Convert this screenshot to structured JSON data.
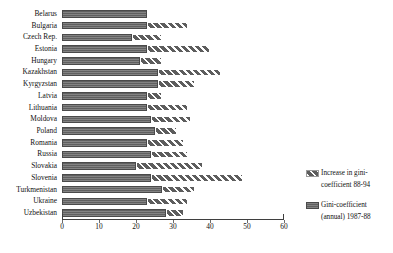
{
  "chart_data": {
    "type": "bar",
    "orientation": "horizontal",
    "stacked": true,
    "title": "",
    "subtitle": "",
    "xlabel": "",
    "ylabel": "",
    "xlim": [
      0,
      60
    ],
    "xticks": [
      0,
      10,
      20,
      30,
      40,
      50,
      60
    ],
    "xtick_labels": [
      "0",
      "10",
      "20",
      "30",
      "40",
      "50",
      "60"
    ],
    "grid": false,
    "legend_position": "right",
    "categories": [
      "Belarus",
      "Bulgaria",
      "Czech Rep.",
      "Estonia",
      "Hungary",
      "Kazakhstan",
      "Kyrgyzstan",
      "Latvia",
      "Lithuania",
      "Moldova",
      "Poland",
      "Romania",
      "Russia",
      "Slovakia",
      "Slovenia",
      "Turkmenistan",
      "Ukraine",
      "Uzbekistan"
    ],
    "series": [
      {
        "name": "Gini-coefficient (annual) 1987-88",
        "key": "base",
        "color": "#6b6b6b",
        "pattern": "solid-dark",
        "values": [
          23,
          23,
          19,
          23,
          21,
          26,
          26,
          23,
          23,
          24,
          25,
          23,
          24,
          20,
          24,
          27,
          23,
          28
        ]
      },
      {
        "name": "Increase in gini-coefficient 88-94",
        "key": "increase",
        "color": "#8e8e8e",
        "pattern": "diagonal-hatch",
        "values": [
          0,
          11,
          8,
          17,
          6,
          17,
          10,
          4,
          11,
          11,
          6,
          10,
          10,
          18,
          25,
          9,
          11,
          5
        ]
      }
    ],
    "totals": [
      23,
      34,
      27,
      40,
      27,
      43,
      36,
      27,
      34,
      35,
      31,
      33,
      34,
      38,
      49,
      36,
      34,
      33
    ]
  },
  "legend": {
    "entries": [
      {
        "swatch": "hatch-swatch",
        "line1": "Increase in gini-",
        "line2": "coefficient 88-94"
      },
      {
        "swatch": "solid-swatch",
        "line1": "Gini-coefficient",
        "line2": "(annual) 1987-88"
      }
    ]
  }
}
